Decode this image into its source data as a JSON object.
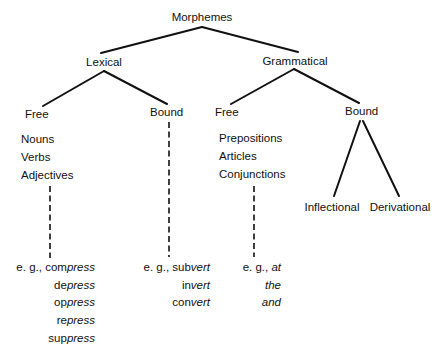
{
  "title": "Morphemes",
  "nodes": {
    "root": "Morphemes",
    "lexical": "Lexical",
    "grammatical": "Grammatical",
    "lexical_free": "Free",
    "lexical_bound": "Bound",
    "grammatical_free": "Free",
    "grammatical_bound": "Bound",
    "inflectional": "Inflectional",
    "derivational": "Derivational"
  },
  "lists": {
    "lexical_free": [
      "Nouns",
      "Verbs",
      "Adjectives"
    ],
    "grammatical_free": [
      "Prepositions",
      "Articles",
      "Conjunctions"
    ]
  },
  "examples": {
    "prefix_label": "e. g.,",
    "lexical_free": [
      {
        "roman": "com",
        "italic": "press"
      },
      {
        "roman": "de",
        "italic": "press"
      },
      {
        "roman": "op",
        "italic": "press"
      },
      {
        "roman": "re",
        "italic": "press"
      },
      {
        "roman": "sup",
        "italic": "press"
      }
    ],
    "lexical_bound": [
      {
        "roman": "sub",
        "italic": "vert"
      },
      {
        "roman": "in",
        "italic": "vert"
      },
      {
        "roman": "con",
        "italic": "vert"
      }
    ],
    "grammatical_free": [
      {
        "roman": "",
        "italic": "at"
      },
      {
        "roman": "",
        "italic": "the"
      },
      {
        "roman": "",
        "italic": "and"
      }
    ]
  },
  "colors": {
    "ink": "#111111",
    "background": "#ffffff"
  }
}
